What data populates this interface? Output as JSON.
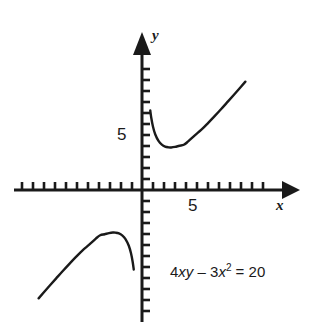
{
  "chart_data": {
    "type": "line",
    "title": "",
    "xlabel": "x",
    "ylabel": "y",
    "equation": "4xy - 3x^2 = 20",
    "equation_parts": {
      "coef_xy": "4",
      "var_xy": "xy",
      "minus": "–",
      "coef_x2": "3",
      "var_x": "x",
      "exponent": "2",
      "equals": "=",
      "rhs": "20"
    },
    "xlim": [
      -11,
      14
    ],
    "ylim": [
      -11,
      13
    ],
    "grid": false,
    "legend": null,
    "axis_ticks": {
      "x_labeled": [
        5
      ],
      "y_labeled": [
        5
      ],
      "tick_spacing_units": 1
    },
    "series": [
      {
        "name": "branch-upper-right",
        "comment": "x > 0 branch of y = (20 + 3x^2)/(4x)",
        "x": [
          0.75,
          0.85,
          1.0,
          1.2,
          1.5,
          1.8,
          2.1,
          2.4,
          2.65,
          3.0,
          3.4,
          3.8,
          4.2,
          4.8,
          5.4,
          6.0,
          6.6,
          7.2,
          7.8,
          8.6,
          9.4
        ],
        "y": [
          7.23,
          6.52,
          5.75,
          5.07,
          4.46,
          4.13,
          3.95,
          3.88,
          3.87,
          3.92,
          4.02,
          4.11,
          4.42,
          4.97,
          5.48,
          6.08,
          6.71,
          7.36,
          8.03,
          8.93,
          9.85
        ]
      },
      {
        "name": "branch-lower-left",
        "comment": "x < 0 branch of y = (20 + 3x^2)/(4x)",
        "x": [
          -9.4,
          -8.6,
          -7.8,
          -7.2,
          -6.6,
          -6.0,
          -5.4,
          -4.8,
          -4.2,
          -3.8,
          -3.4,
          -3.0,
          -2.65,
          -2.4,
          -2.1,
          -1.8,
          -1.5,
          -1.2,
          -1.0,
          -0.85,
          -0.75
        ],
        "y": [
          -9.85,
          -8.93,
          -8.03,
          -7.36,
          -6.71,
          -6.08,
          -5.48,
          -4.97,
          -4.42,
          -4.11,
          -4.02,
          -3.92,
          -3.87,
          -3.88,
          -3.95,
          -4.13,
          -4.46,
          -5.07,
          -5.75,
          -6.52,
          -7.23
        ]
      }
    ],
    "colors": {
      "curve": "#1a1a1a",
      "axis": "#1a1a1a",
      "background": "#ffffff"
    }
  },
  "labels": {
    "y_axis": "y",
    "x_axis": "x",
    "y_tick_5": "5",
    "x_tick_5": "5"
  }
}
